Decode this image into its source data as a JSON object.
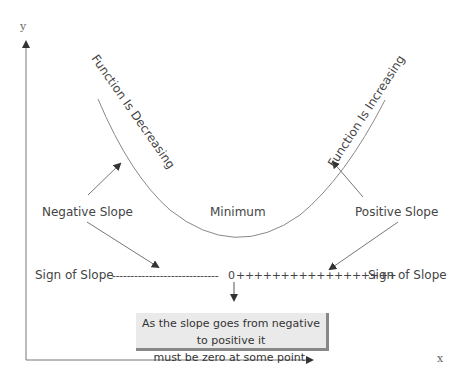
{
  "diagram": {
    "axes": {
      "x_label": "x",
      "y_label": "y"
    },
    "curve_labels": {
      "decreasing": "Function Is Decreasing",
      "increasing": "Function Is Increasing",
      "minimum": "Minimum"
    },
    "slope_labels": {
      "negative": "Negative Slope",
      "positive": "Positive Slope"
    },
    "sign_row": {
      "left_label": "Sign of Slope",
      "negative_marks": "-----------------------------",
      "zero": "0",
      "positive_marks": "++++++++++++++++++",
      "right_label": "Sign of Slope"
    },
    "note": {
      "line1": "As the slope goes from negative to positive it",
      "line2": "must be zero at some point."
    },
    "colors": {
      "line": "#888888",
      "text": "#444444",
      "note_bg": "#eaeaea",
      "note_shadow": "#888888"
    }
  }
}
